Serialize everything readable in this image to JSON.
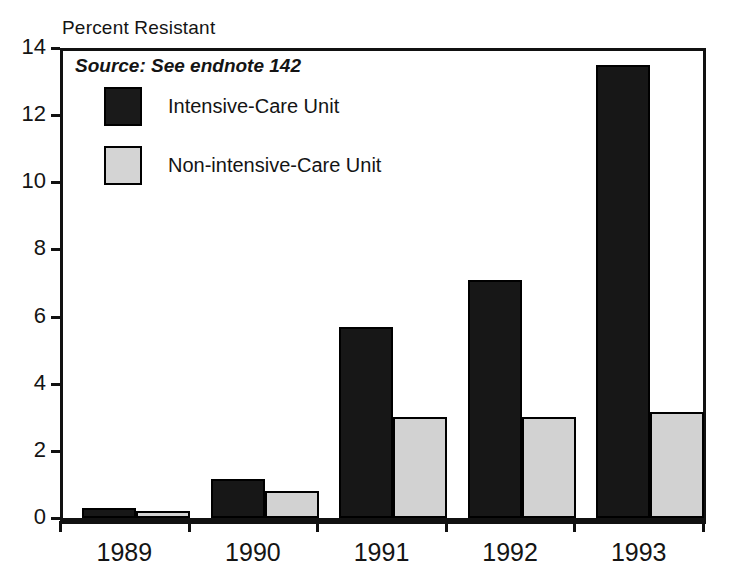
{
  "chart_data": {
    "type": "bar",
    "title": "Percent Resistant",
    "subtitle": "Source: See endnote 142",
    "xlabel": "",
    "ylabel": "Percent Resistant",
    "categories": [
      "1989",
      "1990",
      "1991",
      "1992",
      "1993"
    ],
    "series": [
      {
        "name": "Intensive-Care Unit",
        "color": "#171717",
        "values": [
          0.3,
          1.15,
          5.7,
          7.1,
          13.5
        ]
      },
      {
        "name": "Non-intensive-Care Unit",
        "color": "#d2d2d2",
        "values": [
          0.2,
          0.8,
          3.0,
          3.0,
          3.15
        ]
      }
    ],
    "ylim": [
      0,
      14
    ],
    "yticks": [
      0,
      2,
      4,
      6,
      8,
      10,
      12,
      14
    ],
    "ytick_labels": [
      "0",
      "2",
      "4",
      "6",
      "8",
      "10",
      "12",
      "14"
    ],
    "grid": false,
    "legend_position": "upper-left-inside"
  },
  "axis": {
    "y_title": "Percent Resistant",
    "y_tick_labels": [
      "14",
      "12",
      "10",
      "8",
      "6",
      "4",
      "2",
      "0"
    ],
    "x_tick_labels": [
      "1989",
      "1990",
      "1991",
      "1992",
      "1993"
    ]
  },
  "annotations": {
    "source": "Source: See endnote 142"
  },
  "legend": {
    "entries": [
      {
        "label": "Intensive-Care Unit",
        "swatch": "solid-dark"
      },
      {
        "label": "Non-intensive-Care Unit",
        "swatch": "solid-light"
      }
    ]
  },
  "colors": {
    "series_icu": "#171717",
    "series_nonicu": "#d2d2d2",
    "axis": "#111111",
    "background": "#ffffff",
    "text": "#141414"
  }
}
